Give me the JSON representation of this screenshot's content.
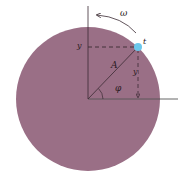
{
  "diagram": {
    "type": "phasor-circle",
    "colors": {
      "disk": "#9a6f86",
      "axis": "#3a2a32",
      "dash": "#3a2a32",
      "point": "#6cc8ec",
      "background": "#ffffff"
    },
    "labels": {
      "omega": "ω",
      "point": "t",
      "amplitude": "A",
      "phase": "φ",
      "y_left": "y",
      "y_right": "y"
    }
  }
}
